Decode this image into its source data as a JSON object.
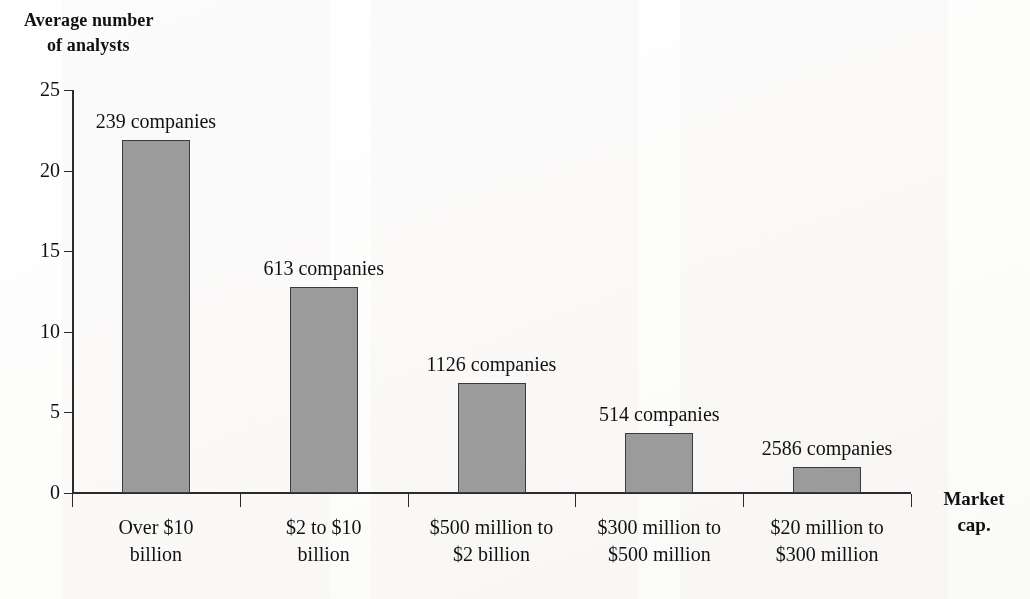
{
  "chart_data": {
    "type": "bar",
    "title": "",
    "ylabel": "Average number\nof analysts",
    "ylabel_line1": "Average number",
    "ylabel_line2": "of analysts",
    "xlabel": "Market\ncap.",
    "xlabel_line1": "Market",
    "xlabel_line2": "cap.",
    "categories": [
      "Over $10\nbillion",
      "$2 to $10\nbillion",
      "$500 million to\n$2 billion",
      "$300 million to\n$500 million",
      "$20 million to\n$300 million"
    ],
    "values": [
      21.9,
      12.8,
      6.8,
      3.75,
      1.6
    ],
    "point_labels": [
      "239 companies",
      "613 companies",
      "1126 companies",
      "514 companies",
      "2586 companies"
    ],
    "company_counts": [
      239,
      613,
      1126,
      514,
      2586
    ],
    "ylim": [
      0,
      25
    ],
    "yticks": [
      0,
      5,
      10,
      15,
      20,
      25
    ],
    "ytick_labels": [
      "0",
      "5",
      "10",
      "15",
      "20",
      "25"
    ],
    "grid": false,
    "legend": false,
    "bar_color": "#9b9b9b",
    "bar_edge_color": "#3a3a3a",
    "axis_color": "#2b2b2b",
    "background": "#ffffff"
  }
}
